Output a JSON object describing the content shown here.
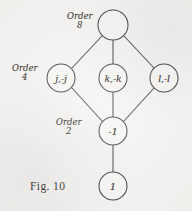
{
  "figure": {
    "caption": "Fig. 10",
    "stroke_color": "#3b3a38",
    "background_color": "#f4f3f0",
    "nodes": [
      {
        "id": "top",
        "label": "",
        "cx": 113,
        "cy": 25,
        "r": 15
      },
      {
        "id": "left",
        "label": "j,-j",
        "cx": 61,
        "cy": 78,
        "r": 14
      },
      {
        "id": "middle",
        "label": "k,-k",
        "cx": 113,
        "cy": 78,
        "r": 14
      },
      {
        "id": "right",
        "label": "l,-l",
        "cx": 164,
        "cy": 78,
        "r": 14
      },
      {
        "id": "minus1",
        "label": "-1",
        "cx": 113,
        "cy": 131,
        "r": 14
      },
      {
        "id": "one",
        "label": "1",
        "cx": 113,
        "cy": 186,
        "r": 14
      }
    ],
    "edges": [
      {
        "from": "top",
        "to": "left"
      },
      {
        "from": "top",
        "to": "middle"
      },
      {
        "from": "top",
        "to": "right"
      },
      {
        "from": "left",
        "to": "minus1"
      },
      {
        "from": "middle",
        "to": "minus1"
      },
      {
        "from": "right",
        "to": "minus1"
      },
      {
        "from": "minus1",
        "to": "one"
      }
    ],
    "order_labels": [
      {
        "id": "order-8",
        "word": "Order",
        "number": "8",
        "x": 67,
        "y": 12
      },
      {
        "id": "order-4",
        "word": "Order",
        "number": "4",
        "x": 12,
        "y": 64
      },
      {
        "id": "order-2",
        "word": "Order",
        "number": "2",
        "x": 56,
        "y": 118
      }
    ]
  }
}
